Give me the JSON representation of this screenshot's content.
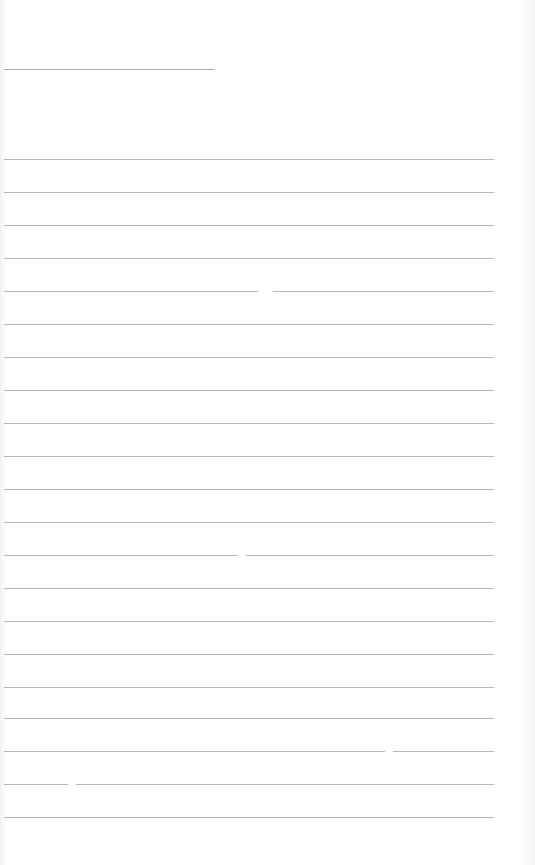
{
  "page": {
    "type": "blank lined paper",
    "header_line": {
      "x1": 4,
      "x2": 214,
      "y": 69
    },
    "ruled_lines": [
      {
        "y": 159,
        "segments": [
          [
            4,
            494
          ]
        ]
      },
      {
        "y": 192,
        "segments": [
          [
            4,
            494
          ]
        ]
      },
      {
        "y": 225,
        "segments": [
          [
            4,
            494
          ]
        ]
      },
      {
        "y": 258,
        "segments": [
          [
            4,
            494
          ]
        ]
      },
      {
        "y": 291,
        "segments": [
          [
            4,
            258
          ],
          [
            273,
            494
          ]
        ]
      },
      {
        "y": 324,
        "segments": [
          [
            4,
            494
          ]
        ]
      },
      {
        "y": 357,
        "segments": [
          [
            4,
            494
          ]
        ]
      },
      {
        "y": 390,
        "segments": [
          [
            4,
            494
          ]
        ]
      },
      {
        "y": 423,
        "segments": [
          [
            4,
            494
          ]
        ]
      },
      {
        "y": 456,
        "segments": [
          [
            4,
            494
          ]
        ]
      },
      {
        "y": 489,
        "segments": [
          [
            4,
            494
          ]
        ]
      },
      {
        "y": 522,
        "segments": [
          [
            4,
            494
          ]
        ]
      },
      {
        "y": 555,
        "segments": [
          [
            4,
            238
          ],
          [
            246,
            494
          ]
        ]
      },
      {
        "y": 588,
        "segments": [
          [
            4,
            494
          ]
        ]
      },
      {
        "y": 621,
        "segments": [
          [
            4,
            494
          ]
        ]
      },
      {
        "y": 654,
        "segments": [
          [
            4,
            494
          ]
        ]
      },
      {
        "y": 687,
        "segments": [
          [
            4,
            494
          ]
        ]
      },
      {
        "y": 718,
        "segments": [
          [
            4,
            494
          ]
        ]
      },
      {
        "y": 751,
        "segments": [
          [
            4,
            385
          ],
          [
            393,
            494
          ]
        ]
      },
      {
        "y": 784,
        "segments": [
          [
            4,
            68
          ],
          [
            76,
            494
          ]
        ]
      },
      {
        "y": 817,
        "segments": [
          [
            4,
            494
          ]
        ]
      }
    ],
    "colors": {
      "background": "#ffffff",
      "rule": "#b8b8b8"
    }
  }
}
